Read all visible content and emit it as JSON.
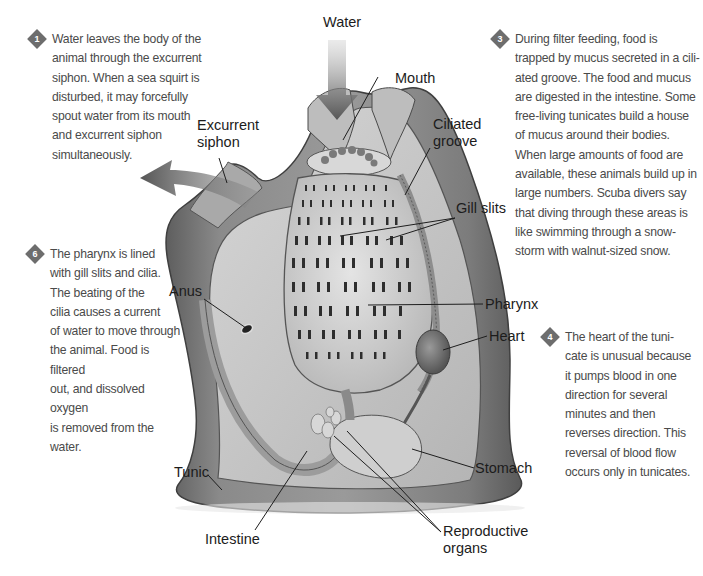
{
  "diagram": {
    "accent_colors": {
      "badge": "#6d6d6d",
      "body_text": "#4a4a4a",
      "label_text": "#1c1c1c",
      "tunic_dark": "#6e6e6e",
      "tissue_light": "#c9c9c9"
    },
    "labels": {
      "water": "Water",
      "mouth": "Mouth",
      "excurrent_siphon_line1": "Excurrent",
      "excurrent_siphon_line2": "siphon",
      "ciliated_groove_line1": "Ciliated",
      "ciliated_groove_line2": "groove",
      "gill_slits": "Gill slits",
      "anus": "Anus",
      "pharynx": "Pharynx",
      "heart": "Heart",
      "stomach": "Stomach",
      "tunic": "Tunic",
      "intestine": "Intestine",
      "reproductive_organs_line1": "Reproductive",
      "reproductive_organs_line2": "organs"
    },
    "callouts": [
      {
        "number": "1",
        "lines": [
          "Water leaves the body of the",
          "animal through the excurrent",
          "siphon. When a sea squirt is",
          "disturbed, it may forcefully",
          "spout water from its mouth",
          "and excurrent siphon",
          "simultaneously."
        ]
      },
      {
        "number": "3",
        "lines": [
          "During filter feeding, food is",
          "trapped by mucus secreted in a cili-",
          "ated groove. The food and mucus",
          "are digested in the intestine. Some",
          "free-living tunicates build a house",
          "of mucus around their bodies.",
          "When large amounts of food are",
          "available, these animals build up in",
          "large numbers. Scuba divers say",
          "that diving through these areas is",
          "like swimming through a snow-",
          "storm with walnut-sized snow."
        ]
      },
      {
        "number": "6",
        "lines": [
          "The pharynx is lined",
          "with gill slits and cilia.",
          "The beating of the",
          "cilia causes a current",
          "of water to move through",
          "the animal. Food is filtered",
          "out, and dissolved oxygen",
          "is removed from the water."
        ]
      },
      {
        "number": "4",
        "lines": [
          "The heart of the tuni-",
          "cate is unusual because",
          "it pumps blood in one",
          "direction for several",
          "minutes and then",
          "reverses direction. This",
          "reversal of blood flow",
          "occurs only in tunicates."
        ]
      }
    ]
  }
}
